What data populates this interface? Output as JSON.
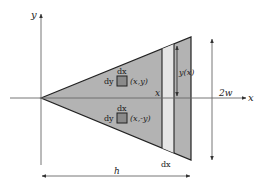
{
  "diagram": {
    "type": "triangular-fin-geometry",
    "colors": {
      "background": "#ffffff",
      "fill": "#b3b3b3",
      "strip_fill": "#e4e4e4",
      "stroke": "#222222",
      "axis": "#555555",
      "element_fill": "#8a8a8a"
    },
    "axes": {
      "x_label": "x",
      "y_label": "y"
    },
    "elements": {
      "upper": {
        "dx": "dx",
        "dy": "dy",
        "coord": "(x,y)"
      },
      "lower": {
        "dx": "dx",
        "dy": "dy",
        "coord": "(x,-y)"
      }
    },
    "strip": {
      "x_label": "x",
      "height_label": "y(x)",
      "width_label": "dx"
    },
    "dimensions": {
      "thickness_label": "2w",
      "length_label": "h"
    }
  }
}
